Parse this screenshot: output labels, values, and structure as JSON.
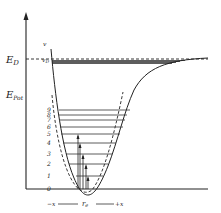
{
  "diagram": {
    "type": "potential-energy-curve",
    "y_axis": {
      "labels": {
        "dissociation_energy": "E",
        "dissociation_energy_sub": "D",
        "potential_energy": "E",
        "potential_energy_sub": "Pot"
      }
    },
    "quantum_number_label": "v",
    "dissociation_level_label": "v",
    "dissociation_level_sub": "D",
    "levels": [
      {
        "label": "0",
        "y": 189
      },
      {
        "label": "1",
        "y": 176
      },
      {
        "label": "2",
        "y": 164
      },
      {
        "label": "3",
        "y": 154
      },
      {
        "label": "4",
        "y": 143
      },
      {
        "label": "5",
        "y": 134
      },
      {
        "label": "6",
        "y": 127
      },
      {
        "label": "7",
        "y": 120
      },
      {
        "label": "8",
        "y": 115
      },
      {
        "label": "9",
        "y": 110
      }
    ],
    "x_axis": {
      "left": "−x",
      "center": "r",
      "center_sub": "e",
      "right": "+x"
    },
    "curves": [
      {
        "name": "morse-potential",
        "style": "solid"
      },
      {
        "name": "harmonic-potential",
        "style": "dashed"
      }
    ]
  }
}
